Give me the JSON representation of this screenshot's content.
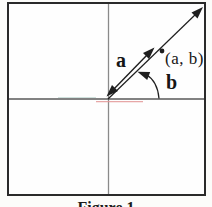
{
  "figure": {
    "caption": "Figure 1",
    "radius_label": "a",
    "angle_label": "b",
    "point_label": "(a, b)"
  },
  "colors": {
    "ink": "#1f1f1f",
    "frame_border": "#2a2a2a",
    "axis_vertical": "#8a8a8a",
    "axis_horizontal": "#585858",
    "scan_artifact_red": "#e49898",
    "scan_artifact_teal": "#abc9c3"
  }
}
